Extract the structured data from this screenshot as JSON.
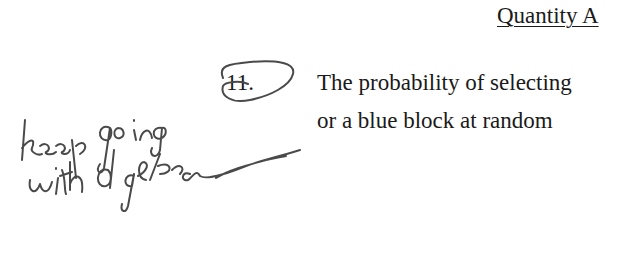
{
  "column_header": "Quantity A",
  "question": {
    "number": "11.",
    "lines": [
      "The probability of selecting",
      "or a blue block at random"
    ]
  },
  "handwriting": {
    "note_lines": [
      "keep going",
      "with algebra"
    ],
    "ink_color": "#4a4a4a"
  }
}
